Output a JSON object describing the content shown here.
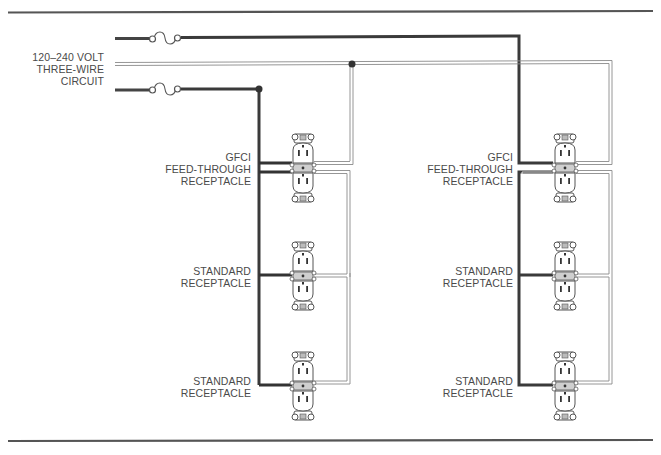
{
  "diagram": {
    "type": "wiring-diagram",
    "source_label": [
      "120–240 VOLT",
      "THREE-WIRE",
      "CIRCUIT"
    ],
    "left_branch": {
      "receptacles": [
        {
          "label": [
            "GFCI",
            "FEED-THROUGH",
            "RECEPTACLE"
          ]
        },
        {
          "label": [
            "STANDARD",
            "RECEPTACLE"
          ]
        },
        {
          "label": [
            "STANDARD",
            "RECEPTACLE"
          ]
        }
      ]
    },
    "right_branch": {
      "receptacles": [
        {
          "label": [
            "GFCI",
            "FEED-THROUGH",
            "RECEPTACLE"
          ]
        },
        {
          "label": [
            "STANDARD",
            "RECEPTACLE"
          ]
        },
        {
          "label": [
            "STANDARD",
            "RECEPTACLE"
          ]
        }
      ]
    },
    "components": {
      "fuses": 2,
      "junctions": 2,
      "wires": [
        "hot-1",
        "neutral",
        "hot-2"
      ]
    },
    "colors": {
      "hot_wire": "#3a3a3a",
      "neutral_wire": "#9a9a9a",
      "rule": "#555555",
      "text": "#4a4a4a"
    }
  }
}
